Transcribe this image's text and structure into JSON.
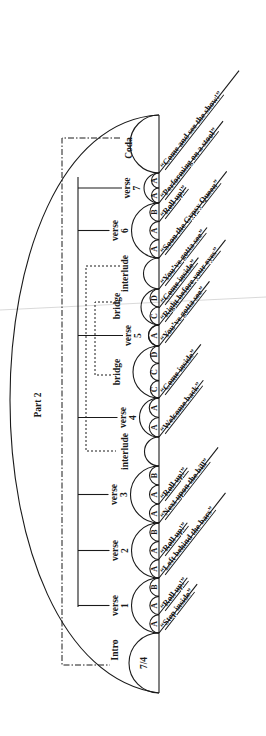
{
  "title": "Part 2",
  "time_signature": "7/4",
  "sections": [
    {
      "name": "Intro",
      "label": "Intro",
      "segments": [],
      "inner_text": "7/4"
    },
    {
      "name": "verse-1",
      "label_line1": "verse",
      "label_line2": "1",
      "segments": [
        "A",
        "A",
        "B"
      ]
    },
    {
      "name": "verse-2",
      "label_line1": "verse",
      "label_line2": "2",
      "segments": [
        "A",
        "A",
        "B"
      ]
    },
    {
      "name": "verse-3",
      "label_line1": "verse",
      "label_line2": "3",
      "segments": [
        "A",
        "A",
        "B"
      ]
    },
    {
      "name": "interlude-1",
      "label": "interlude",
      "segments": []
    },
    {
      "name": "verse-4",
      "label_line1": "verse",
      "label_line2": "4",
      "segments": [
        "A",
        "A"
      ]
    },
    {
      "name": "bridge-1",
      "label": "bridge",
      "segments": [
        "C",
        "C",
        "D"
      ]
    },
    {
      "name": "verse-5",
      "label_line1": "verse",
      "label_line2": "5",
      "segments": [
        "A"
      ]
    },
    {
      "name": "bridge-2",
      "label": "bridge",
      "segments": [
        "C",
        "D"
      ]
    },
    {
      "name": "interlude-2",
      "label": "interlude",
      "segments": []
    },
    {
      "name": "verse-6",
      "label_line1": "verse",
      "label_line2": "6",
      "segments": [
        "A",
        "A",
        "B"
      ]
    },
    {
      "name": "verse-7",
      "label_line1": "verse",
      "label_line2": "7",
      "segments": [
        "A",
        "A"
      ]
    },
    {
      "name": "Coda",
      "label": "Coda",
      "segments": []
    }
  ],
  "lyrics": [
    "“Step inside”",
    "“Roll up!”",
    "“Left behind the bars”",
    "“Roll up!”",
    "“Next upon the bill”",
    "“Roll up!”",
    "“Welcome back”",
    "“Come inside”",
    "“You’ve gotta see”",
    "“Right before your eyes”",
    "“Come inside”",
    "“You’ve gotta see”",
    "“Soon the Gypsy Queen”",
    "“Roll up!”",
    "“Performing on a stool”",
    "“Come and see the show!”"
  ]
}
